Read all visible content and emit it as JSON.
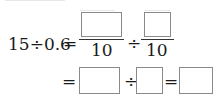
{
  "equation": {
    "row1": {
      "lhs": "15÷0.6",
      "equals": "=",
      "fraction1": {
        "numerator": "",
        "denominator": "10"
      },
      "divide": "÷",
      "fraction2": {
        "numerator": "",
        "denominator": "10"
      }
    },
    "row2": {
      "equals1": "=",
      "box1": "",
      "divide": "÷",
      "box2": "",
      "equals2": "=",
      "box3": ""
    }
  }
}
